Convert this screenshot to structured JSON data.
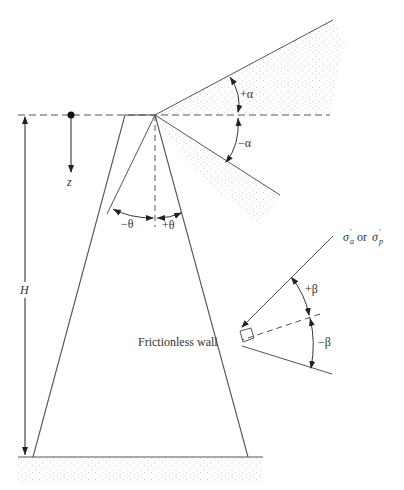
{
  "diagram": {
    "labels": {
      "plus_alpha": "+α",
      "minus_alpha": "−α",
      "minus_theta": "−θ",
      "plus_theta": "+θ",
      "plus_beta": "+β",
      "minus_beta": "−β",
      "z": "z",
      "H": "H",
      "frictionless_wall": "Frictionless wall",
      "sigma_a": "σ",
      "sigma_a_sub": "a",
      "sigma_or": "or",
      "sigma_p": "σ",
      "sigma_p_sub": "p",
      "prime": "′"
    },
    "colors": {
      "line": "#555555",
      "dashed": "#555555",
      "soil_dots": "#b8b8b8",
      "text": "#333333"
    }
  }
}
